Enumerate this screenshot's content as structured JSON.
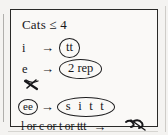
{
  "note": {
    "title": "Cats ≤ 4",
    "arrow_glyph": "→",
    "lines": [
      {
        "id": "rule-i",
        "lhs": "i",
        "arrow": "→",
        "rhs": "tt",
        "rhs_circled": true
      },
      {
        "id": "rule-e",
        "lhs": "e",
        "arrow": "→",
        "rhs": "2 rep",
        "rhs_circled": true
      },
      {
        "id": "rule-ee",
        "lhs": "ee",
        "lhs_circled": true,
        "arrow": "→",
        "rhs": "s i t t",
        "rhs_circled": true
      }
    ],
    "bottom_rule": {
      "id": "rule-bottom",
      "text": "l or c or t or ttt",
      "arrow": "→",
      "rhs_mark": "scribble"
    },
    "marks": [
      {
        "id": "scribble-middle",
        "kind": "crossed-out-scribble"
      },
      {
        "id": "scribble-bottom-right",
        "kind": "crossed-out-scribble"
      }
    ],
    "colors": {
      "ink": "#17171a",
      "frame": "#2a2a28",
      "paper": "#faf9f7",
      "scan_background": "#f4f3f1"
    }
  }
}
